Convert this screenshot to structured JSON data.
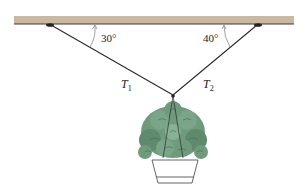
{
  "diagram": {
    "type": "statics-free-body",
    "ceiling": {
      "color": "#c9b9a1",
      "edge_color": "#3a3a3a"
    },
    "angles": [
      {
        "id": "left",
        "label": "30°"
      },
      {
        "id": "right",
        "label": "40°"
      }
    ],
    "tensions": [
      {
        "id": "T1",
        "symbol": "T",
        "subscript": "1"
      },
      {
        "id": "T2",
        "symbol": "T",
        "subscript": "2"
      }
    ],
    "object": {
      "name": "hanging plant",
      "leaf_color": "#6f9a7c",
      "leaf_dark": "#3f6a4e"
    }
  }
}
